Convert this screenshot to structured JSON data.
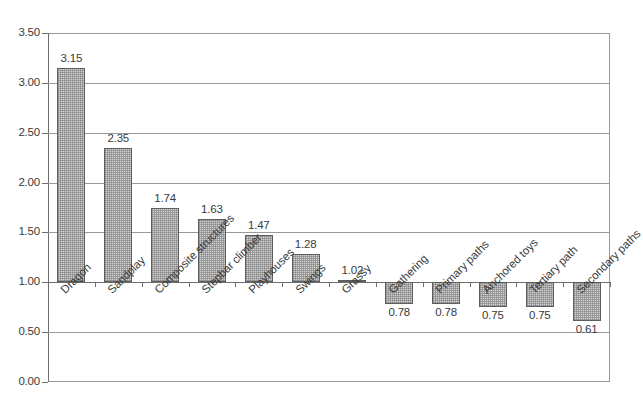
{
  "chart_data": {
    "type": "bar",
    "title": "",
    "subtitle": "",
    "xlabel": "",
    "ylabel": "",
    "ylim": [
      0.0,
      3.5
    ],
    "baseline": 1.0,
    "grid": true,
    "legend": "none",
    "ytick_labels": [
      "3.50",
      "3.00",
      "2.50",
      "2.00",
      "1.50",
      "1.00",
      "0.50",
      "0.00"
    ],
    "ytick_values": [
      3.5,
      3.0,
      2.5,
      2.0,
      1.5,
      1.0,
      0.5,
      0.0
    ],
    "categories": [
      "Dragon",
      "Sandplay",
      "Composite structures",
      "Stepbar climber",
      "Playhouses",
      "Swings",
      "Grassy",
      "Gathering",
      "Primary paths",
      "Anchored toys",
      "Tertiary path",
      "Secondary paths"
    ],
    "values": [
      3.15,
      2.35,
      1.74,
      1.63,
      1.47,
      1.28,
      1.02,
      0.78,
      0.78,
      0.75,
      0.75,
      0.61
    ],
    "value_labels": [
      "3.15",
      "2.35",
      "1.74",
      "1.63",
      "1.47",
      "1.28",
      "1.02",
      "0.78",
      "0.78",
      "0.75",
      "0.75",
      "0.61"
    ],
    "colors": {
      "bar_fill": "#d2d2d2",
      "bar_border": "#5d5d5d",
      "gridline": "#9a9a9a",
      "axis": "#6e6e6e",
      "text": "#3a3a3a",
      "background": "#ffffff"
    }
  }
}
